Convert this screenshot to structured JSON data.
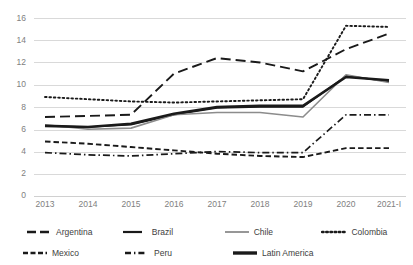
{
  "chart_data": {
    "type": "line",
    "title": "",
    "subtitle": "",
    "xlabel": "",
    "ylabel": "",
    "grid": true,
    "legend_position": "bottom",
    "ylim": [
      0,
      16
    ],
    "yticks": [
      0,
      2,
      4,
      6,
      8,
      10,
      12,
      14,
      16
    ],
    "ytick_labels": [
      "0",
      "2",
      "4",
      "6",
      "8",
      "10",
      "12",
      "14",
      "16"
    ],
    "categories": [
      "2013",
      "2014",
      "2015",
      "2016",
      "2017",
      "2018",
      "2019",
      "2020",
      "2021-I"
    ],
    "series": [
      {
        "name": "Argentina",
        "style": "long-dash",
        "color": "#1a1a1a",
        "width": 1.9,
        "values": [
          7.1,
          7.2,
          7.3,
          11.0,
          12.4,
          12.0,
          11.2,
          13.2,
          14.6
        ]
      },
      {
        "name": "Brazil",
        "style": "solid-thin",
        "color": "#1a1a1a",
        "width": 1.5,
        "values": [
          6.3,
          6.2,
          6.4,
          7.3,
          7.9,
          8.0,
          8.0,
          10.8,
          10.3
        ]
      },
      {
        "name": "Chile",
        "style": "solid-gray",
        "color": "#8c8c8c",
        "width": 1.6,
        "values": [
          6.4,
          6.0,
          6.1,
          7.3,
          7.5,
          7.5,
          7.1,
          10.9,
          10.2
        ]
      },
      {
        "name": "Colombia",
        "style": "dotted",
        "color": "#1a1a1a",
        "width": 1.9,
        "values": [
          8.9,
          8.7,
          8.5,
          8.4,
          8.5,
          8.6,
          8.7,
          15.3,
          15.2
        ]
      },
      {
        "name": "Mexico",
        "style": "dash",
        "color": "#1a1a1a",
        "width": 1.9,
        "values": [
          4.9,
          4.7,
          4.4,
          4.1,
          3.8,
          3.6,
          3.5,
          4.3,
          4.3
        ]
      },
      {
        "name": "Peru",
        "style": "dash-dot",
        "color": "#1a1a1a",
        "width": 1.7,
        "values": [
          3.9,
          3.7,
          3.6,
          3.8,
          4.0,
          3.9,
          3.9,
          7.3,
          7.3
        ]
      },
      {
        "name": "Latin America",
        "style": "solid-thick",
        "color": "#1a1a1a",
        "width": 2.6,
        "values": [
          6.3,
          6.2,
          6.5,
          7.4,
          8.0,
          8.1,
          8.1,
          10.7,
          10.4
        ]
      }
    ]
  },
  "axis": {
    "y_labels": [
      "16",
      "14",
      "12",
      "10",
      "8",
      "6",
      "4",
      "2",
      "0"
    ],
    "x_labels": [
      "2013",
      "2014",
      "2015",
      "2016",
      "2017",
      "2018",
      "2019",
      "2020",
      "2021-I"
    ]
  },
  "legend": {
    "row1": [
      "Argentina",
      "Brazil",
      "Chile",
      "Colombia"
    ],
    "row2": [
      "Mexico",
      "Peru",
      "Latin America"
    ]
  }
}
